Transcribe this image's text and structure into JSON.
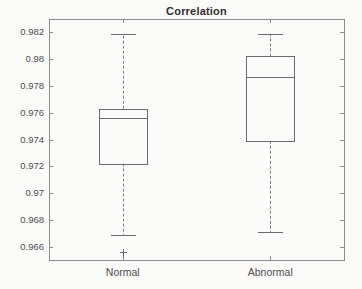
{
  "figure": {
    "background": "#fbfbfa"
  },
  "chart_data": {
    "type": "boxplot",
    "title": "Correlation",
    "categories": [
      "Normal",
      "Abnormal"
    ],
    "xlabel": "",
    "ylabel": "",
    "ylim": [
      0.965,
      0.983
    ],
    "yticks": [
      0.966,
      0.968,
      0.97,
      0.972,
      0.974,
      0.976,
      0.978,
      0.98,
      0.982
    ],
    "ytick_labels": [
      "0.966",
      "0.968",
      "0.97",
      "0.972",
      "0.974",
      "0.976",
      "0.978",
      "0.98",
      "0.982"
    ],
    "grid": false,
    "box_frame": true,
    "whisker_style": "dashed",
    "series": [
      {
        "name": "Normal",
        "q1": 0.9722,
        "median": 0.9756,
        "q3": 0.9763,
        "whisker_low": 0.9669,
        "whisker_high": 0.9819,
        "outliers": [
          0.9656
        ]
      },
      {
        "name": "Abnormal",
        "q1": 0.9739,
        "median": 0.9787,
        "q3": 0.9802,
        "whisker_low": 0.9671,
        "whisker_high": 0.9819,
        "outliers": []
      }
    ],
    "colors": {
      "axis": "#8c8c8c",
      "box": "#6b6b6b",
      "median": "#6b6b6b",
      "whisker": "#7d7d7d",
      "cap": "#6b6b6b",
      "outlier": "#6b6b6b",
      "tick_text": "#4d4d4d",
      "title_text": "#2f2f2f"
    }
  }
}
